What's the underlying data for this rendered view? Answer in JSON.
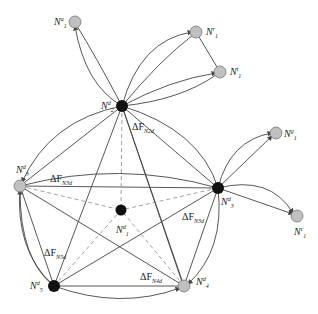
{
  "diagram": {
    "colors": {
      "edge": "#444444",
      "dashed": "#888888",
      "black_node": "#111111",
      "gray_node": "#c0c0c0",
      "gray_stroke": "#777777"
    },
    "nodes": [
      {
        "id": "N1a",
        "label_base": "N",
        "sup": "a",
        "sub": "1",
        "x": 75,
        "y": 22,
        "type": "gray",
        "lx": 54,
        "ly": 16
      },
      {
        "id": "N1r",
        "label_base": "N",
        "sup": "r",
        "sub": "1",
        "x": 196,
        "y": 32,
        "type": "gray",
        "lx": 206,
        "ly": 26
      },
      {
        "id": "N1t",
        "label_base": "N",
        "sup": "t",
        "sub": "1",
        "x": 220,
        "y": 72,
        "type": "gray",
        "lx": 230,
        "ly": 66
      },
      {
        "id": "N2d",
        "label_base": "N",
        "sup": "d",
        "sub": "2",
        "x": 122,
        "y": 106,
        "type": "black",
        "lx": 101,
        "ly": 100
      },
      {
        "id": "N3dL",
        "label_base": "N",
        "sup": "d",
        "sub": "3",
        "x": 20,
        "y": 186,
        "type": "gray",
        "lx": 16,
        "ly": 164
      },
      {
        "id": "N1d",
        "label_base": "N",
        "sup": "d",
        "sub": "1",
        "x": 121,
        "y": 210,
        "type": "black",
        "lx": 116,
        "ly": 224
      },
      {
        "id": "N3d",
        "label_base": "N",
        "sup": "d",
        "sub": "3",
        "x": 218,
        "y": 188,
        "type": "black",
        "lx": 221,
        "ly": 196
      },
      {
        "id": "N1g",
        "label_base": "N",
        "sup": "g",
        "sub": "1",
        "x": 276,
        "y": 133,
        "type": "gray",
        "lx": 284,
        "ly": 128
      },
      {
        "id": "N1c",
        "label_base": "N",
        "sup": "c",
        "sub": "1",
        "x": 297,
        "y": 216,
        "type": "gray",
        "lx": 294,
        "ly": 226
      },
      {
        "id": "N5d",
        "label_base": "N",
        "sup": "d",
        "sub": "5",
        "x": 54,
        "y": 286,
        "type": "black",
        "lx": 30,
        "ly": 280
      },
      {
        "id": "N4d",
        "label_base": "N",
        "sup": "d",
        "sub": "4",
        "x": 184,
        "y": 286,
        "type": "gray",
        "lx": 196,
        "ly": 276
      }
    ],
    "delta_labels": [
      {
        "text": "ΔF",
        "sub": "N2d",
        "x": 132,
        "y": 122
      },
      {
        "text": "ΔF",
        "sub": "N3d",
        "x": 50,
        "y": 174
      },
      {
        "text": "ΔF",
        "sub": "N3d",
        "x": 182,
        "y": 212
      },
      {
        "text": "ΔF",
        "sub": "N5d",
        "x": 44,
        "y": 248
      },
      {
        "text": "ΔF",
        "sub": "N4d",
        "x": 140,
        "y": 272
      }
    ]
  }
}
